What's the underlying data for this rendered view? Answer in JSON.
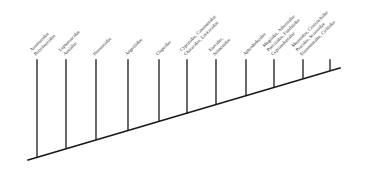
{
  "figure": {
    "type": "cladogram",
    "title": "",
    "background_color": "#ffffff",
    "line_color": "#1a1a1a",
    "label_color": "#2b2b2b",
    "label_rotation_deg": -45,
    "tip_count": 11,
    "backbone": {
      "x1": 28,
      "y1": 160,
      "x2": 340,
      "y2": 68
    }
  },
  "tips": [
    {
      "id": "tip-1",
      "branch": {
        "x": 37,
        "y_top": 60,
        "y_bottom": 157
      },
      "label_x": 37,
      "label_y": 57,
      "lines": [
        "Arrenuroidae",
        "Polychoerlidae"
      ]
    },
    {
      "id": "tip-2",
      "branch": {
        "x": 66,
        "y_top": 60,
        "y_bottom": 148
      },
      "label_x": 66,
      "label_y": 57,
      "lines": [
        "Leptostracidae",
        "Anulidae"
      ]
    },
    {
      "id": "tip-3",
      "branch": {
        "x": 96,
        "y_top": 60,
        "y_bottom": 139
      },
      "label_x": 96,
      "label_y": 57,
      "lines": [
        "Haustoriidae"
      ]
    },
    {
      "id": "tip-4",
      "branch": {
        "x": 128,
        "y_top": 60,
        "y_bottom": 130
      },
      "label_x": 128,
      "label_y": 57,
      "lines": [
        "Anguillidae"
      ]
    },
    {
      "id": "tip-5",
      "branch": {
        "x": 159,
        "y_top": 60,
        "y_bottom": 121
      },
      "label_x": 159,
      "label_y": 57,
      "lines": [
        "Clupeidae"
      ]
    },
    {
      "id": "tip-6",
      "branch": {
        "x": 187,
        "y_top": 60,
        "y_bottom": 113
      },
      "label_x": 187,
      "label_y": 57,
      "lines": [
        "Cyprinidae, Catostomidae",
        "Characidae, Loricariidae"
      ]
    },
    {
      "id": "tip-7",
      "branch": {
        "x": 216,
        "y_top": 60,
        "y_bottom": 104
      },
      "label_x": 216,
      "label_y": 57,
      "lines": [
        "Esocidae,",
        "Salmonidae"
      ]
    },
    {
      "id": "tip-8",
      "branch": {
        "x": 246,
        "y_top": 60,
        "y_bottom": 95
      },
      "label_x": 246,
      "label_y": 57,
      "lines": [
        "Aphredoderidae"
      ]
    },
    {
      "id": "tip-9",
      "branch": {
        "x": 274,
        "y_top": 60,
        "y_bottom": 87
      },
      "label_x": 274,
      "label_y": 57,
      "lines": [
        "Mugilidae, Atherinidae",
        "Poeciliidae, Fundulidae",
        "Cyprinodontidae"
      ]
    },
    {
      "id": "tip-10",
      "branch": {
        "x": 303,
        "y_top": 60,
        "y_bottom": 78
      },
      "label_x": 303,
      "label_y": 57,
      "lines": [
        "Moronidae, Centrarchidae",
        "Percidae, Sciaenidae",
        "Elassomatidae, Cichlidae"
      ]
    },
    {
      "id": "tip-11",
      "branch": {
        "x": 330,
        "y_top": 60,
        "y_bottom": 70
      },
      "label_x": 330,
      "label_y": 57,
      "lines": [
        ""
      ]
    }
  ]
}
